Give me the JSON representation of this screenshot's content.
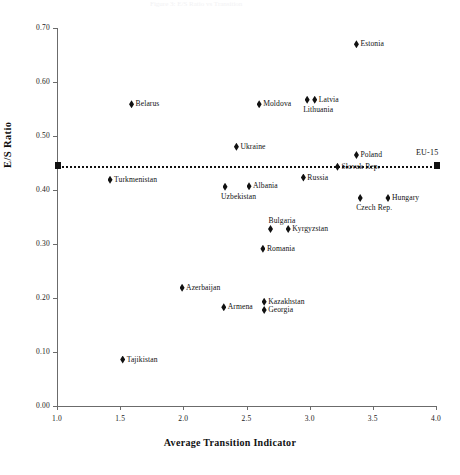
{
  "figure": {
    "ghost_title": "Figure 3: E/S Ratio vs Transition"
  },
  "axes": {
    "y_title": "E/S Ratio",
    "x_title": "Average Transition Indicator",
    "y_ticks": [
      "0.00",
      "0.10",
      "0.20",
      "0.30",
      "0.40",
      "0.50",
      "0.60",
      "0.70"
    ],
    "x_ticks": [
      "1.0",
      "1.5",
      "2.0",
      "2.5",
      "3.0",
      "3.5",
      "4.0"
    ]
  },
  "reference": {
    "label": "EU-15",
    "value": 0.445,
    "x_start": 1.0,
    "x_end": 4.0,
    "marker_color": "#111111"
  },
  "chart_data": {
    "type": "scatter",
    "title": "",
    "xlabel": "Average Transition Indicator",
    "ylabel": "E/S Ratio",
    "xlim": [
      1.0,
      4.0
    ],
    "ylim": [
      0.0,
      0.7
    ],
    "grid": false,
    "legend": "none",
    "annotations": [
      {
        "text": "EU-15",
        "x": 3.87,
        "y": 0.468,
        "type": "reference-line-label"
      }
    ],
    "points": [
      {
        "label": "Estonia",
        "x": 3.37,
        "y": 0.67,
        "label_pos": "right"
      },
      {
        "label": "Belarus",
        "x": 1.59,
        "y": 0.559,
        "label_pos": "right"
      },
      {
        "label": "Moldova",
        "x": 2.6,
        "y": 0.559,
        "label_pos": "right"
      },
      {
        "label": "Latvia",
        "x": 3.04,
        "y": 0.567,
        "label_pos": "right"
      },
      {
        "label": "Lithuania",
        "x": 2.98,
        "y": 0.567,
        "label_pos": "below"
      },
      {
        "label": "Ukraine",
        "x": 2.42,
        "y": 0.48,
        "label_pos": "right"
      },
      {
        "label": "Poland",
        "x": 3.37,
        "y": 0.465,
        "label_pos": "right"
      },
      {
        "label": "Slovak Rep.",
        "x": 3.22,
        "y": 0.443,
        "label_pos": "right"
      },
      {
        "label": "Russia",
        "x": 2.95,
        "y": 0.423,
        "label_pos": "right"
      },
      {
        "label": "Turkmenistan",
        "x": 1.42,
        "y": 0.419,
        "label_pos": "right"
      },
      {
        "label": "Albania",
        "x": 2.52,
        "y": 0.407,
        "label_pos": "right"
      },
      {
        "label": "Uzbekistan",
        "x": 2.33,
        "y": 0.406,
        "label_pos": "below"
      },
      {
        "label": "Czech Rep.",
        "x": 3.4,
        "y": 0.385,
        "label_pos": "below"
      },
      {
        "label": "Hungary",
        "x": 3.62,
        "y": 0.385,
        "label_pos": "right"
      },
      {
        "label": "Kyrgyzstan",
        "x": 2.83,
        "y": 0.328,
        "label_pos": "right"
      },
      {
        "label": "Bulgaria",
        "x": 2.69,
        "y": 0.328,
        "label_pos": "above"
      },
      {
        "label": "Romania",
        "x": 2.63,
        "y": 0.291,
        "label_pos": "right"
      },
      {
        "label": "Azerbaijan",
        "x": 1.99,
        "y": 0.219,
        "label_pos": "right"
      },
      {
        "label": "Kazakhstan",
        "x": 2.64,
        "y": 0.193,
        "label_pos": "right"
      },
      {
        "label": "Armena",
        "x": 2.32,
        "y": 0.183,
        "label_pos": "right"
      },
      {
        "label": "Georgia",
        "x": 2.64,
        "y": 0.178,
        "label_pos": "right"
      },
      {
        "label": "Tajikistan",
        "x": 1.52,
        "y": 0.086,
        "label_pos": "right"
      }
    ]
  }
}
